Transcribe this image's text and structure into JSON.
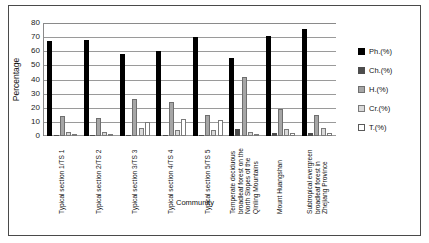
{
  "chart_data": {
    "type": "bar",
    "title": "",
    "xlabel": "Community",
    "ylabel": "Percentage",
    "ylim": [
      0,
      80
    ],
    "yticks": [
      "0",
      "10",
      "20",
      "30",
      "40",
      "50",
      "60",
      "70",
      "80"
    ],
    "grid": true,
    "legend_position": "right",
    "categories": [
      "Typical section 1/TS 1",
      "Typical section 2/TS 2",
      "Typical section 3/TS 3",
      "Typical section 4/TS 4",
      "Typical section 5/TS 5",
      "Temperate deciduous broadleaf forest on the North Slopes of the Qinling Mountains",
      "Mount Huangshan",
      "Subtropical evergreen broadleaf forest in Zhejiang Province"
    ],
    "series": [
      {
        "name": "Ph.(%)",
        "color": "#000000",
        "values": [
          67,
          68,
          58,
          60,
          70,
          55,
          71,
          76
        ]
      },
      {
        "name": "Ch.(%)",
        "color": "#4d4d4d",
        "values": [
          1,
          1,
          1,
          1,
          1,
          5,
          2,
          2
        ]
      },
      {
        "name": "H.(%)",
        "color": "#a6a6a6",
        "values": [
          14,
          13,
          26,
          24,
          15,
          42,
          19,
          15
        ]
      },
      {
        "name": "Cr.(%)",
        "color": "#d9d9d9",
        "values": [
          3,
          3,
          6,
          4,
          4,
          3,
          5,
          6
        ]
      },
      {
        "name": "T.(%)",
        "color": "#ffffff",
        "values": [
          1,
          1,
          10,
          12,
          11,
          1,
          2,
          2
        ]
      }
    ]
  },
  "legend": {
    "items": [
      {
        "label": "Ph.(%)"
      },
      {
        "label": "Ch.(%)"
      },
      {
        "label": "H.(%)"
      },
      {
        "label": "Cr.(%)"
      },
      {
        "label": "T.(%)"
      }
    ]
  }
}
